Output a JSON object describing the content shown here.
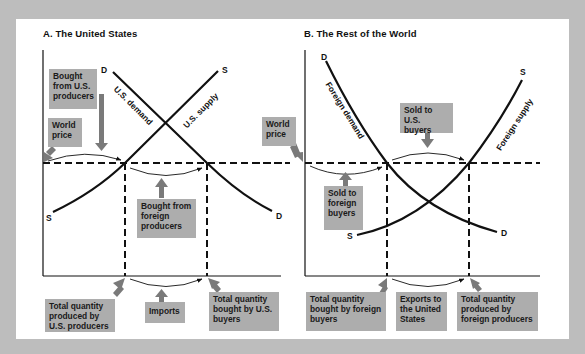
{
  "panel_a": {
    "title": "A. The United States",
    "curves": {
      "demand_label": "U.S. demand",
      "supply_label": "U.S. supply",
      "demand_top": "D",
      "demand_bottom": "D",
      "supply_top": "S",
      "supply_bottom": "S"
    },
    "boxes": {
      "bought_from_us": "Bought from U.S. producers",
      "world_price": "World price",
      "bought_from_foreign": "Bought from foreign producers",
      "total_produced": "Total quantity produced by U.S. producers",
      "imports": "Imports",
      "total_bought": "Total quantity bought by U.S. buyers"
    }
  },
  "panel_b": {
    "title": "B. The Rest of the World",
    "curves": {
      "demand_label": "Foreign demand",
      "supply_label": "Foreign supply",
      "demand_top": "D",
      "demand_bottom": "D",
      "supply_top": "S",
      "supply_bottom": "S"
    },
    "boxes": {
      "world_price": "World price",
      "sold_to_us": "Sold to U.S. buyers",
      "sold_to_foreign": "Sold to foreign buyers",
      "total_bought": "Total quantity bought by foreign buyers",
      "exports": "Exports to the United States",
      "total_produced": "Total quantity produced by foreign producers"
    }
  },
  "colors": {
    "background": "#bdbdbd",
    "panel": "#ffffff",
    "box": "#adadad",
    "arrow": "#7a7a7a",
    "line": "#111111"
  }
}
